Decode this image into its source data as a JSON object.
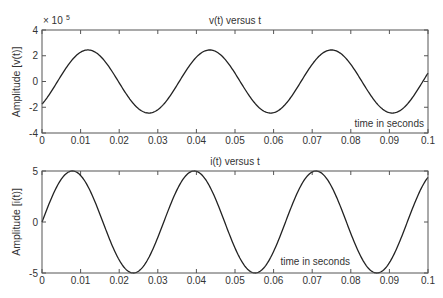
{
  "chart_data": [
    {
      "type": "line",
      "title": "v(t) versus t",
      "xlabel": "",
      "ylabel": "Amplitude [v(t)]",
      "annotation": "time in seconds",
      "exponent_label": "× 10",
      "exponent_power": "5",
      "xlim": [
        0,
        0.1
      ],
      "ylim": [
        -4,
        4
      ],
      "y_scale": 100000,
      "xticks": [
        "0",
        "0.01",
        "0.02",
        "0.03",
        "0.04",
        "0.05",
        "0.06",
        "0.07",
        "0.08",
        "0.09",
        "0.1"
      ],
      "yticks": [
        "-4",
        "-2",
        "0",
        "2",
        "4"
      ],
      "grid": false,
      "series": [
        {
          "name": "v(t)",
          "model": "A*sin(2*pi*f*t + phi)",
          "amplitude": 2.45,
          "frequency_hz": 31.7,
          "phase_rad": -0.8,
          "x": [
            0,
            0.0115,
            0.027,
            0.043,
            0.059,
            0.075,
            0.091,
            0.1
          ],
          "values": [
            -1.75,
            2.45,
            -2.45,
            2.45,
            -2.45,
            2.45,
            -2.45,
            0.7
          ]
        }
      ]
    },
    {
      "type": "line",
      "title": "i(t) versus t",
      "xlabel": "",
      "ylabel": "Amplitude [i(t)]",
      "annotation": "time in seconds",
      "xlim": [
        0,
        0.1
      ],
      "ylim": [
        -5,
        5
      ],
      "xticks": [
        "0",
        "0.01",
        "0.02",
        "0.03",
        "0.04",
        "0.05",
        "0.06",
        "0.07",
        "0.08",
        "0.09",
        "0.1"
      ],
      "yticks": [
        "-5",
        "0",
        "5"
      ],
      "grid": false,
      "series": [
        {
          "name": "i(t)",
          "model": "A*sin(2*pi*f*t + phi)",
          "amplitude": 5,
          "frequency_hz": 31.7,
          "phase_rad": 0,
          "x": [
            0,
            0.0079,
            0.0237,
            0.0394,
            0.0552,
            0.071,
            0.0868,
            0.1
          ],
          "values": [
            0,
            5,
            -5,
            5,
            -5,
            5,
            -5,
            4.2
          ]
        }
      ]
    }
  ]
}
